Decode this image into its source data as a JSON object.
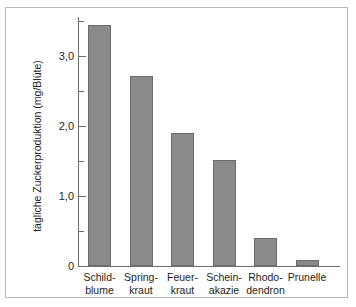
{
  "chart_data": {
    "type": "bar",
    "title": "",
    "subtitle": "",
    "xlabel": "",
    "ylabel": "tägliche Zuckerproduktion (mg/Blüte)",
    "ylim": [
      0,
      3.55
    ],
    "ytick_labels": [
      "0",
      "1,0",
      "2,0",
      "3,0"
    ],
    "ytick_values": [
      0,
      1.0,
      2.0,
      3.0
    ],
    "yminor_values": [
      0.5,
      1.5,
      2.5,
      3.5
    ],
    "grid": false,
    "legend": "none",
    "bar_color": "#8a8a8a",
    "bar_edge_color": "#6d6d6d",
    "axis_color": "#6e6e6e",
    "categories": [
      "Schild-\nblume",
      "Spring-\nkraut",
      "Feuer-\nkraut",
      "Schein-\nakazie",
      "Rhodo-\ndendron",
      "Prunelle"
    ],
    "category_lines": [
      [
        "Schild-",
        "blume"
      ],
      [
        "Spring-",
        "kraut"
      ],
      [
        "Feuer-",
        "kraut"
      ],
      [
        "Schein-",
        "akazie"
      ],
      [
        "Rhodo-",
        "dendron"
      ],
      [
        "Prunelle",
        ""
      ]
    ],
    "values": [
      3.45,
      2.72,
      1.9,
      1.52,
      0.4,
      0.08
    ]
  }
}
